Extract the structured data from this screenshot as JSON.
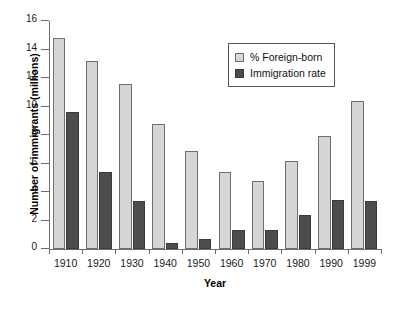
{
  "chart_data": {
    "type": "bar",
    "title": "",
    "xlabel": "Year",
    "ylabel": "Number of immigrants (millions)",
    "categories": [
      "1910",
      "1920",
      "1930",
      "1940",
      "1950",
      "1960",
      "1970",
      "1980",
      "1990",
      "1999"
    ],
    "series": [
      {
        "name": "% Foreign-born",
        "color": "#d6d6d6",
        "values": [
          14.8,
          13.2,
          11.6,
          8.8,
          6.9,
          5.4,
          4.8,
          6.2,
          7.9,
          10.4
        ]
      },
      {
        "name": "Immigration rate",
        "color": "#4d4d4d",
        "values": [
          9.6,
          5.4,
          3.35,
          0.42,
          0.68,
          1.35,
          1.35,
          2.4,
          3.45,
          3.4
        ]
      }
    ],
    "ylim": [
      0,
      16
    ],
    "yticks": [
      0,
      2,
      4,
      6,
      8,
      10,
      12,
      14,
      16
    ],
    "ytick_labels": [
      "0",
      "2",
      "4",
      "6",
      "8",
      "10",
      "12",
      "14",
      "16"
    ],
    "grid": false,
    "legend_position": "upper-right-inside"
  },
  "legend": {
    "entries": [
      {
        "label": "% Foreign-born"
      },
      {
        "label": "Immigration rate"
      }
    ]
  }
}
